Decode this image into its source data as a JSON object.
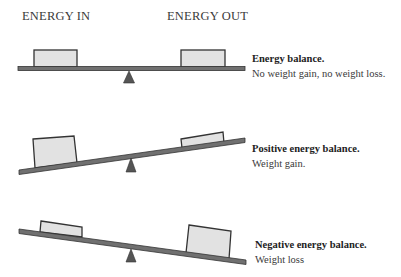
{
  "headers": {
    "energy_in": "ENERGY IN",
    "energy_out": "ENERGY OUT"
  },
  "panels": [
    {
      "title": "Energy balance.",
      "description": "No weight gain, no weight loss.",
      "state": "balanced",
      "energy_in_size": "equal",
      "energy_out_size": "equal"
    },
    {
      "title": "Positive energy balance.",
      "description": "Weight gain.",
      "state": "tilted-left-down",
      "energy_in_size": "large",
      "energy_out_size": "small"
    },
    {
      "title": "Negative energy balance.",
      "description": "Weight loss",
      "state": "tilted-right-down",
      "energy_in_size": "small",
      "energy_out_size": "large"
    }
  ],
  "colors": {
    "beam": "#6e6e6e",
    "beam_outline": "#333333",
    "box_fill": "#e2e2e2",
    "box_outline": "#333333",
    "fulcrum": "#555555",
    "text": "#3a3a3a"
  }
}
